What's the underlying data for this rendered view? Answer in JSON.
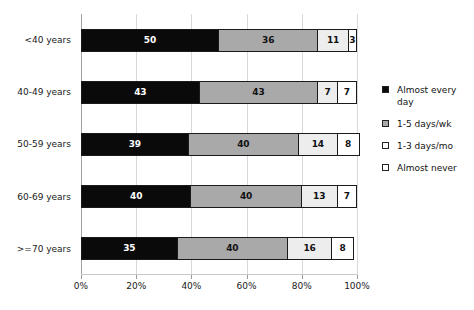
{
  "chart_data": {
    "type": "bar",
    "orientation": "horizontal",
    "stacked": true,
    "normalized_percent": true,
    "title": "",
    "subtitle": "",
    "xlabel": "",
    "ylabel": "",
    "xlim": [
      0,
      100
    ],
    "xticks": [
      "0%",
      "20%",
      "40%",
      "60%",
      "80%",
      "100%"
    ],
    "xtick_values": [
      0,
      20,
      40,
      60,
      80,
      100
    ],
    "grid": "vertical",
    "legend_position": "right",
    "categories": [
      "<40 years",
      "40-49 years",
      "50-59 years",
      "60-69 years",
      ">=70 years"
    ],
    "series": [
      {
        "name": "Almost every day",
        "color": "#0a0a0a",
        "text_color": "#ffffff",
        "values": [
          50,
          43,
          39,
          40,
          35
        ]
      },
      {
        "name": "1-5 days/wk",
        "color": "#a9a9a9",
        "text_color": "#111111",
        "values": [
          36,
          43,
          40,
          40,
          40
        ]
      },
      {
        "name": "1-3 days/mo",
        "color": "#ededed",
        "text_color": "#111111",
        "values": [
          11,
          7,
          14,
          13,
          16
        ]
      },
      {
        "name": "Almost never",
        "color": "#ffffff",
        "text_color": "#111111",
        "values": [
          3,
          7,
          8,
          7,
          8
        ]
      }
    ]
  },
  "legend": {
    "items": [
      {
        "label": "Almost every day",
        "swatch": "legend-swatch-almost-every-day"
      },
      {
        "label": "1-5 days/wk",
        "swatch": "legend-swatch-1-5-days-wk"
      },
      {
        "label": "1-3 days/mo",
        "swatch": "legend-swatch-1-3-days-mo"
      },
      {
        "label": "Almost never",
        "swatch": "legend-swatch-almost-never"
      }
    ]
  }
}
